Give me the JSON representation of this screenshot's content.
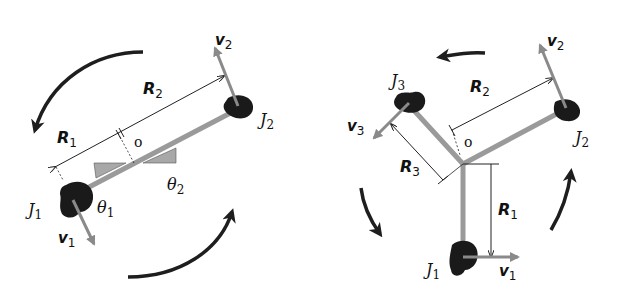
{
  "colors": {
    "rod": "#9a9a9a",
    "mass": "#1a1a1a",
    "velocity": "#8a8a8a",
    "rotation_arrow": "#1e1e1e",
    "dimension_line": "#222222",
    "angle_fill": "#a8a8a8",
    "background": "#ffffff"
  },
  "left_diagram": {
    "name": "two-body system",
    "center_label": "o",
    "bodies": [
      {
        "label_main": "J",
        "label_sub": "1",
        "velocity_main": "v",
        "velocity_sub": "1",
        "angle_main": "θ",
        "angle_sub": "1"
      },
      {
        "label_main": "J",
        "label_sub": "2",
        "velocity_main": "v",
        "velocity_sub": "2",
        "angle_main": "θ",
        "angle_sub": "2"
      }
    ],
    "radii": [
      {
        "main": "R",
        "sub": "1"
      },
      {
        "main": "R",
        "sub": "2"
      }
    ],
    "rotation": "counterclockwise"
  },
  "right_diagram": {
    "name": "three-body system",
    "center_label": "o",
    "bodies": [
      {
        "label_main": "J",
        "label_sub": "1",
        "velocity_main": "v",
        "velocity_sub": "1"
      },
      {
        "label_main": "J",
        "label_sub": "2",
        "velocity_main": "v",
        "velocity_sub": "2"
      },
      {
        "label_main": "J",
        "label_sub": "3",
        "velocity_main": "v",
        "velocity_sub": "3"
      }
    ],
    "radii": [
      {
        "main": "R",
        "sub": "1"
      },
      {
        "main": "R",
        "sub": "2"
      },
      {
        "main": "R",
        "sub": "3"
      }
    ],
    "rotation": "counterclockwise"
  }
}
